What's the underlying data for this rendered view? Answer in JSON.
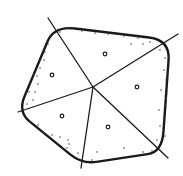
{
  "diagram": {
    "stroke_color": "#1a1a1a",
    "background": "#ffffff",
    "center": [
      93,
      87
    ],
    "outline": [
      [
        54,
        26
      ],
      [
        170,
        40
      ],
      [
        162,
        152
      ],
      [
        82,
        164
      ],
      [
        18,
        112
      ]
    ],
    "spokes": [
      {
        "from": [
          93,
          87
        ],
        "to": [
          48,
          18
        ]
      },
      {
        "from": [
          93,
          87
        ],
        "to": [
          178,
          34
        ]
      },
      {
        "from": [
          93,
          87
        ],
        "to": [
          168,
          158
        ]
      },
      {
        "from": [
          93,
          87
        ],
        "to": [
          81,
          168
        ]
      },
      {
        "from": [
          93,
          87
        ],
        "to": [
          18,
          112
        ]
      }
    ],
    "sector_circles": [
      [
        105,
        54
      ],
      [
        52,
        75
      ],
      [
        137,
        87
      ],
      [
        62,
        116
      ],
      [
        108,
        127
      ]
    ],
    "border_dots": [
      [
        50,
        36
      ],
      [
        48,
        44
      ],
      [
        45,
        52
      ],
      [
        44,
        60
      ],
      [
        40,
        68
      ],
      [
        37,
        76
      ],
      [
        38,
        84
      ],
      [
        35,
        92
      ],
      [
        33,
        100
      ],
      [
        29,
        92
      ],
      [
        27,
        104
      ],
      [
        60,
        32
      ],
      [
        70,
        29
      ],
      [
        82,
        31
      ],
      [
        95,
        33
      ],
      [
        108,
        34
      ],
      [
        124,
        36
      ],
      [
        138,
        38
      ],
      [
        150,
        42
      ],
      [
        143,
        44
      ],
      [
        131,
        44
      ],
      [
        160,
        50
      ],
      [
        165,
        58
      ],
      [
        164,
        70
      ],
      [
        166,
        80
      ],
      [
        161,
        90
      ],
      [
        166,
        98
      ],
      [
        159,
        110
      ],
      [
        164,
        118
      ],
      [
        160,
        126
      ],
      [
        165,
        136
      ],
      [
        157,
        140
      ],
      [
        30,
        122
      ],
      [
        38,
        125
      ],
      [
        43,
        132
      ],
      [
        52,
        135
      ],
      [
        60,
        137
      ],
      [
        68,
        140
      ],
      [
        69,
        144
      ],
      [
        67,
        148
      ],
      [
        78,
        153
      ],
      [
        97,
        152
      ],
      [
        124,
        148
      ],
      [
        143,
        152
      ],
      [
        152,
        151
      ],
      [
        92,
        160
      ]
    ]
  }
}
